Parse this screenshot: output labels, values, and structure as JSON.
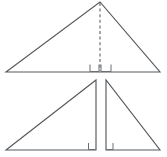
{
  "figure": {
    "canvas": {
      "width": 167,
      "height": 157
    },
    "background_color": "#ffffff",
    "line_color": "#555a5e",
    "dashed_line_color": "#55595d",
    "right_angle_mark_color": "#6a6f73"
  },
  "chart_data": {
    "type": "diagram",
    "shapes": [
      {
        "name": "top-triangle",
        "kind": "triangle",
        "description": "Single triangle with an altitude drawn from the apex to the base",
        "points": [
          {
            "label": "left-vertex",
            "x": 6,
            "y": 72
          },
          {
            "label": "apex",
            "x": 100,
            "y": 2
          },
          {
            "label": "right-vertex",
            "x": 160,
            "y": 72
          }
        ]
      },
      {
        "name": "top-altitude",
        "kind": "dashed-segment",
        "description": "Dashed altitude from apex perpendicular to base",
        "from": {
          "x": 100,
          "y": 2
        },
        "to": {
          "x": 100,
          "y": 72
        }
      },
      {
        "name": "bottom-left-triangle",
        "kind": "right-triangle",
        "description": "Left piece after cutting along the altitude",
        "points": [
          {
            "label": "left-vertex",
            "x": 6,
            "y": 150
          },
          {
            "label": "apex",
            "x": 96,
            "y": 80
          },
          {
            "label": "right-angle-vertex",
            "x": 96,
            "y": 150
          }
        ]
      },
      {
        "name": "bottom-right-triangle",
        "kind": "right-triangle",
        "description": "Right piece after cutting along the altitude",
        "points": [
          {
            "label": "left-angle-vertex",
            "x": 106,
            "y": 150
          },
          {
            "label": "apex",
            "x": 106,
            "y": 80
          },
          {
            "label": "right-vertex",
            "x": 160,
            "y": 150
          }
        ]
      }
    ],
    "right_angle_marks": [
      {
        "name": "top-left-right-angle",
        "x": 90,
        "y": 64,
        "size": 8,
        "corner": "bottom-right"
      },
      {
        "name": "top-right-right-angle",
        "x": 101,
        "y": 64,
        "size": 8,
        "corner": "bottom-left"
      },
      {
        "name": "bottom-left-right-angle",
        "x": 89,
        "y": 143,
        "size": 7,
        "corner": "bottom-right"
      },
      {
        "name": "bottom-right-right-angle",
        "x": 106,
        "y": 143,
        "size": 7,
        "corner": "bottom-left"
      }
    ],
    "annotations": [],
    "labels": [],
    "legend": []
  }
}
